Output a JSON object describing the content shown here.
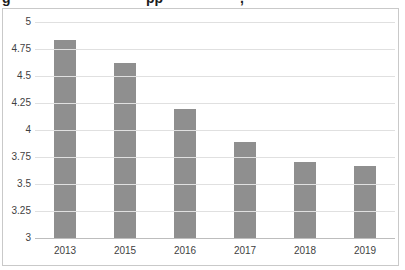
{
  "page": {
    "clipped_header": {
      "note": "bottom sliver of a cropped title line, only descenders visible",
      "fragments": [
        {
          "glyph": "g",
          "x": 2
        },
        {
          "glyph": "pp",
          "x": 146
        },
        {
          "glyph": ",",
          "x": 240
        }
      ]
    }
  },
  "chart_data": {
    "type": "bar",
    "title": "",
    "categories": [
      "2013",
      "2015",
      "2016",
      "2017",
      "2018",
      "2019"
    ],
    "values": [
      4.83,
      4.62,
      4.19,
      3.89,
      3.7,
      3.67
    ],
    "xlabel": "",
    "ylabel": "",
    "ylim": [
      3,
      5
    ],
    "ytick_step": 0.25,
    "ytick_labels_top_to_bottom": [
      "5",
      "4.75",
      "4.5",
      "4.25",
      "4",
      "3.75",
      "3.5",
      "3.25",
      "3"
    ],
    "grid": true,
    "legend": "none",
    "colors": {
      "bar": "#8f8f8f",
      "gridline": "#e0e0e0",
      "axis_line": "#bdbdbd",
      "tick_label": "#3f3f3f",
      "frame_border": "#c9c9c9",
      "background": "#ffffff"
    }
  }
}
